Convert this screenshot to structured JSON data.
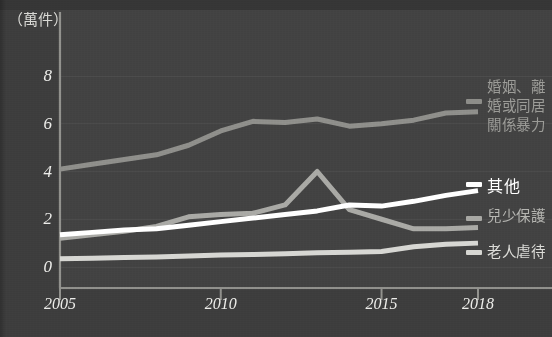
{
  "chart_data": {
    "type": "line",
    "title": "",
    "subtitle": "",
    "unit_caption": "（萬件）",
    "xlabel": "",
    "ylabel": "",
    "xlim": [
      2005,
      2018
    ],
    "ylim": [
      0,
      9
    ],
    "yticks": [
      0,
      2,
      4,
      6,
      8
    ],
    "ytick_labels": [
      "0",
      "2",
      "4",
      "6",
      "8"
    ],
    "xticks": [
      2005,
      2010,
      2015,
      2018
    ],
    "xtick_labels": [
      "2005",
      "2010",
      "2015",
      "2018"
    ],
    "grid": true,
    "grid_axis": "y",
    "legend_position": "right-of-plot-at-series-end",
    "x": [
      2005,
      2006,
      2007,
      2008,
      2009,
      2010,
      2011,
      2012,
      2013,
      2014,
      2015,
      2016,
      2017,
      2018
    ],
    "series": [
      {
        "name": "婚姻、離婚或同居關係暴力",
        "color": "#8d8d89",
        "values": [
          4.1,
          4.3,
          4.5,
          4.7,
          5.1,
          5.7,
          6.1,
          6.05,
          6.2,
          5.9,
          6.0,
          6.15,
          6.45,
          6.5
        ]
      },
      {
        "name": "其他",
        "color": "#ffffff",
        "values": [
          1.35,
          1.45,
          1.55,
          1.6,
          1.75,
          1.9,
          2.05,
          2.2,
          2.35,
          2.6,
          2.55,
          2.75,
          3.0,
          3.2
        ]
      },
      {
        "name": "兒少保護",
        "color": "#a8a8a4",
        "values": [
          1.2,
          1.35,
          1.5,
          1.7,
          2.1,
          2.2,
          2.25,
          2.6,
          4.0,
          2.4,
          2.0,
          1.6,
          1.6,
          1.65
        ]
      },
      {
        "name": "老人虐待",
        "color": "#d6d6d2",
        "values": [
          0.35,
          0.37,
          0.4,
          0.42,
          0.46,
          0.5,
          0.52,
          0.55,
          0.6,
          0.62,
          0.65,
          0.85,
          0.95,
          1.0
        ]
      }
    ]
  },
  "labels": {
    "unit": "（萬件）",
    "marriage_line1": "婚姻、離",
    "marriage_line2": "婚或同居",
    "marriage_line3": "關係暴力",
    "other": "其他",
    "child": "兒少保護",
    "elder": "老人虐待"
  },
  "colors": {
    "background": "#3c3c3c",
    "plot_panel": "#414141",
    "axis": "#8f8f8b",
    "grid": "#4a4a4a",
    "tick_text": "#ededea",
    "marriage": "#8d8d89",
    "other": "#ffffff",
    "child": "#a8a8a4",
    "elder": "#d6d6d2"
  }
}
